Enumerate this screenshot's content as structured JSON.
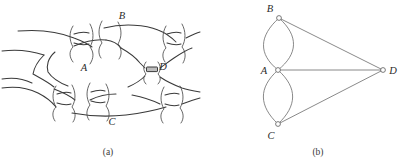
{
  "figure": {
    "background_color": "#ffffff",
    "line_color": "#3a3a3a",
    "bridge_fill_color": "#bdbdbd",
    "node_fill_color": "#ffffff",
    "edge_color": "#6b6b6b",
    "panels": [
      {
        "id": "a",
        "caption": "(a)",
        "caption_x": 108,
        "caption_y": 152,
        "kind": "schematic-map",
        "description": "River map with four landmasses joined by seven bridges",
        "region_labels": [
          {
            "text": "A",
            "x": 84,
            "y": 71
          },
          {
            "text": "B",
            "x": 122,
            "y": 19
          },
          {
            "text": "C",
            "x": 112,
            "y": 125
          },
          {
            "text": "D",
            "x": 163,
            "y": 70
          }
        ],
        "bridge_count": 7
      },
      {
        "id": "b",
        "caption": "(b)",
        "caption_x": 318,
        "caption_y": 152,
        "kind": "multigraph",
        "description": "Multigraph of the bridge map",
        "nodes": [
          {
            "id": "B",
            "label": "B",
            "x": 279,
            "y": 18,
            "label_x": 270,
            "label_y": 11
          },
          {
            "id": "A",
            "label": "A",
            "x": 278,
            "y": 70,
            "label_x": 263,
            "label_y": 73
          },
          {
            "id": "C",
            "label": "C",
            "x": 278,
            "y": 124,
            "label_x": 270,
            "label_y": 138
          },
          {
            "id": "D",
            "label": "D",
            "x": 383,
            "y": 70,
            "label_x": 391,
            "label_y": 73
          }
        ],
        "edges": [
          {
            "from": "A",
            "to": "B",
            "kind": "curve",
            "bow": -22
          },
          {
            "from": "A",
            "to": "B",
            "kind": "curve",
            "bow": 22
          },
          {
            "from": "A",
            "to": "C",
            "kind": "curve",
            "bow": -22
          },
          {
            "from": "A",
            "to": "C",
            "kind": "curve",
            "bow": 22
          },
          {
            "from": "A",
            "to": "D",
            "kind": "line"
          },
          {
            "from": "B",
            "to": "D",
            "kind": "line"
          },
          {
            "from": "C",
            "to": "D",
            "kind": "line"
          }
        ],
        "degree": {
          "A": 5,
          "B": 3,
          "C": 3,
          "D": 3
        }
      }
    ]
  }
}
